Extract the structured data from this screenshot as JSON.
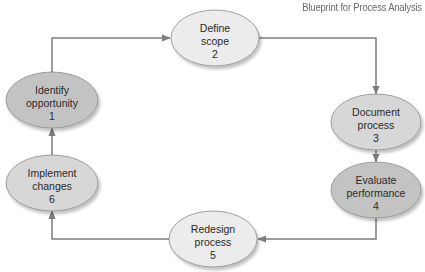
{
  "title": "Blueprint for Process Analysis",
  "colors": {
    "shade_dark": "#c3c3c3",
    "shade_mid": "#d7d7d7",
    "shade_light": "#ececec",
    "stroke": "#8a8a8a",
    "connector": "#7d7d7d"
  },
  "steps": [
    {
      "number": "1",
      "line1": "Identify",
      "line2": "opportunity",
      "shade": "shade_dark"
    },
    {
      "number": "2",
      "line1": "Define",
      "line2": "scope",
      "shade": "shade_light"
    },
    {
      "number": "3",
      "line1": "Document",
      "line2": "process",
      "shade": "shade_mid"
    },
    {
      "number": "4",
      "line1": "Evaluate",
      "line2": "performance",
      "shade": "shade_dark"
    },
    {
      "number": "5",
      "line1": "Redesign",
      "line2": "process",
      "shade": "shade_light"
    },
    {
      "number": "6",
      "line1": "Implement",
      "line2": "changes",
      "shade": "shade_mid"
    }
  ],
  "flow": [
    [
      "1",
      "2"
    ],
    [
      "2",
      "3"
    ],
    [
      "3",
      "4"
    ],
    [
      "4",
      "5"
    ],
    [
      "5",
      "6"
    ],
    [
      "6",
      "1"
    ]
  ]
}
